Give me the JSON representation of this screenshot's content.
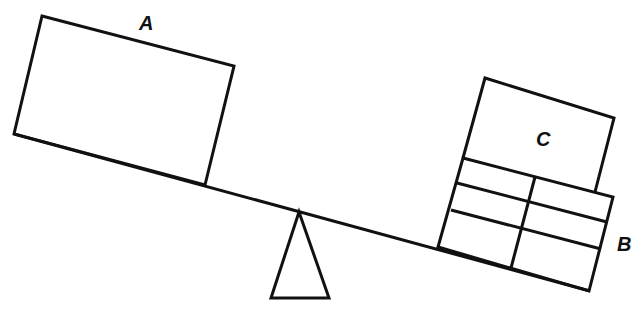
{
  "diagram": {
    "type": "seesaw balance illustration",
    "labels": {
      "block_a": "A",
      "block_b": "B",
      "block_c": "C"
    },
    "colors": {
      "line": "#111111",
      "background": "#ffffff"
    }
  }
}
